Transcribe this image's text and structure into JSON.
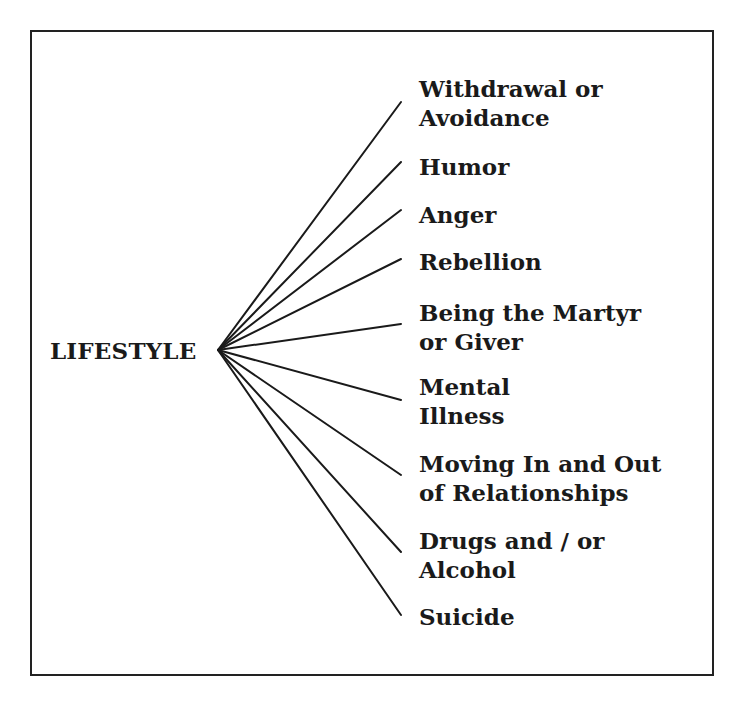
{
  "diagram": {
    "root": {
      "label": "LIFESTYLE",
      "anchor": {
        "x": 218,
        "y": 350
      }
    },
    "branches": [
      {
        "lines": [
          "Withdrawal or",
          "Avoidance"
        ],
        "end": {
          "x": 401,
          "y": 102
        },
        "top": 74
      },
      {
        "lines": [
          "Humor"
        ],
        "end": {
          "x": 401,
          "y": 162
        },
        "top": 152
      },
      {
        "lines": [
          "Anger"
        ],
        "end": {
          "x": 401,
          "y": 210
        },
        "top": 200
      },
      {
        "lines": [
          "Rebellion"
        ],
        "end": {
          "x": 401,
          "y": 259
        },
        "top": 247
      },
      {
        "lines": [
          "Being the Martyr",
          "or Giver"
        ],
        "end": {
          "x": 401,
          "y": 324
        },
        "top": 298
      },
      {
        "lines": [
          "Mental",
          "Illness"
        ],
        "end": {
          "x": 401,
          "y": 400
        },
        "top": 372
      },
      {
        "lines": [
          "Moving In and Out",
          "of Relationships"
        ],
        "end": {
          "x": 401,
          "y": 475
        },
        "top": 449
      },
      {
        "lines": [
          "Drugs and / or",
          "Alcohol"
        ],
        "end": {
          "x": 401,
          "y": 552
        },
        "top": 526
      },
      {
        "lines": [
          "Suicide"
        ],
        "end": {
          "x": 401,
          "y": 615
        },
        "top": 602
      }
    ],
    "colors": {
      "line": "#1a1a1a",
      "text": "#1a1a1a",
      "frame": "#222222"
    }
  }
}
